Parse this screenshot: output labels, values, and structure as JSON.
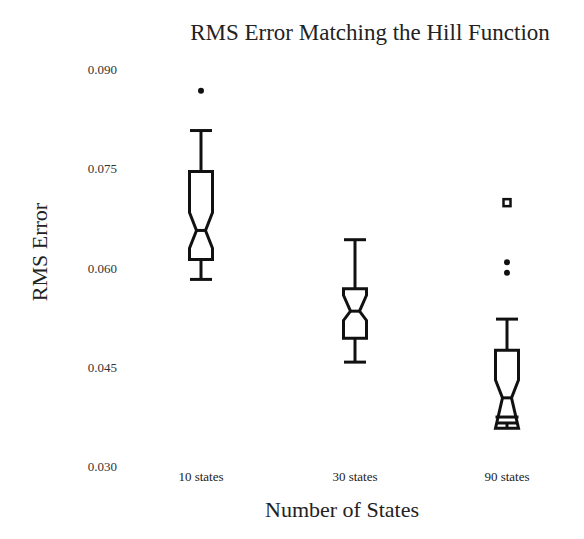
{
  "chart_data": {
    "type": "boxplot",
    "title": "RMS Error Matching the Hill Function",
    "xlabel": "Number of States",
    "ylabel": "RMS Error",
    "ylim": [
      0.03,
      0.09
    ],
    "yticks": [
      {
        "value": 0.03,
        "label": "0.030"
      },
      {
        "value": 0.045,
        "label": "0.045"
      },
      {
        "value": 0.06,
        "label": "0.060"
      },
      {
        "value": 0.075,
        "label": "0.075"
      },
      {
        "value": 0.09,
        "label": "0.090"
      }
    ],
    "grid": false,
    "notched": true,
    "categories": [
      "10 states",
      "30 states",
      "90 states"
    ],
    "boxes": [
      {
        "category": "10 states",
        "whisker_low": 0.0582,
        "q1": 0.0612,
        "notch_low": 0.0629,
        "median": 0.0656,
        "notch_high": 0.0683,
        "q3": 0.0745,
        "whisker_high": 0.0807,
        "outliers": [
          {
            "value": 0.0867,
            "marker": "dot"
          }
        ]
      },
      {
        "category": "30 states",
        "whisker_low": 0.0457,
        "q1": 0.0493,
        "notch_low": 0.052,
        "median": 0.0534,
        "notch_high": 0.0558,
        "q3": 0.0568,
        "whisker_high": 0.0642,
        "outliers": []
      },
      {
        "category": "90 states",
        "whisker_low": 0.0365,
        "q1": 0.0374,
        "notch_low": 0.0357,
        "median": 0.0403,
        "notch_high": 0.043,
        "q3": 0.0475,
        "whisker_high": 0.0522,
        "outliers": [
          {
            "value": 0.0698,
            "marker": "square"
          },
          {
            "value": 0.0608,
            "marker": "dot"
          },
          {
            "value": 0.0592,
            "marker": "dot"
          }
        ]
      }
    ]
  }
}
